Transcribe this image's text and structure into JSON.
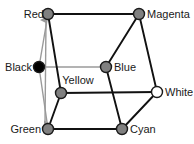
{
  "diagram": {
    "type": "color-cube-vertex-diagram",
    "canvas": {
      "width": 194,
      "height": 144,
      "background": "#ffffff"
    },
    "colors": {
      "vertex_fill_gray": "#808080",
      "vertex_fill_black": "#000000",
      "vertex_fill_white": "#ffffff",
      "vertex_stroke": "#1a1a1a",
      "edge_black": "#111111",
      "edge_gray": "#9a9a9a",
      "arrow_gray": "#9a9a9a",
      "label_color": "#1a1a1a"
    },
    "nodes": [
      {
        "id": "red",
        "label": "Red",
        "x": 48,
        "y": 14,
        "r": 5.5,
        "fill": "#808080",
        "label_pos": "left",
        "lx": 44,
        "ly": 14
      },
      {
        "id": "magenta",
        "label": "Magenta",
        "x": 139,
        "y": 14,
        "r": 5.5,
        "fill": "#808080",
        "label_pos": "right",
        "lx": 147,
        "ly": 14
      },
      {
        "id": "black",
        "label": "Black",
        "x": 39,
        "y": 67,
        "r": 5.5,
        "fill": "#000000",
        "label_pos": "left",
        "lx": 32,
        "ly": 67
      },
      {
        "id": "blue",
        "label": "Blue",
        "x": 106,
        "y": 67,
        "r": 5.5,
        "fill": "#808080",
        "label_pos": "right",
        "lx": 114,
        "ly": 67
      },
      {
        "id": "yellow",
        "label": "Yellow",
        "x": 61,
        "y": 93,
        "r": 5.5,
        "fill": "#808080",
        "label_pos": "above",
        "lx": 78,
        "ly": 86
      },
      {
        "id": "white",
        "label": "White",
        "x": 157,
        "y": 92,
        "r": 5.5,
        "fill": "#ffffff",
        "label_pos": "right",
        "lx": 165,
        "ly": 92
      },
      {
        "id": "green",
        "label": "Green",
        "x": 48,
        "y": 129,
        "r": 5.5,
        "fill": "#808080",
        "label_pos": "left",
        "lx": 41,
        "ly": 129
      },
      {
        "id": "cyan",
        "label": "Cyan",
        "x": 122,
        "y": 129,
        "r": 5.5,
        "fill": "#808080",
        "label_pos": "right",
        "lx": 130,
        "ly": 129
      }
    ],
    "edges": [
      {
        "id": "red-magenta",
        "from": "red",
        "to": "magenta",
        "style": "black"
      },
      {
        "id": "red-yellow",
        "from": "red",
        "to": "yellow",
        "style": "black"
      },
      {
        "id": "red-black",
        "from": "red",
        "to": "black",
        "style": "gray"
      },
      {
        "id": "black-blue",
        "from": "black",
        "to": "blue",
        "style": "gray"
      },
      {
        "id": "black-green",
        "from": "black",
        "to": "green",
        "style": "gray"
      },
      {
        "id": "magenta-blue",
        "from": "magenta",
        "to": "blue",
        "style": "black"
      },
      {
        "id": "magenta-white",
        "from": "magenta",
        "to": "white",
        "style": "black"
      },
      {
        "id": "blue-cyan",
        "from": "blue",
        "to": "cyan",
        "style": "black"
      },
      {
        "id": "yellow-white",
        "from": "yellow",
        "to": "white",
        "style": "black"
      },
      {
        "id": "yellow-green",
        "from": "yellow",
        "to": "green",
        "style": "black"
      },
      {
        "id": "white-cyan",
        "from": "white",
        "to": "cyan",
        "style": "black"
      },
      {
        "id": "green-cyan",
        "from": "green",
        "to": "cyan",
        "style": "black"
      }
    ],
    "arrow": {
      "id": "gray-axis-arrow",
      "description": "double-headed gray arrow from near Red down to near Green",
      "x1": 46,
      "y1": 20,
      "x2": 45,
      "y2": 124,
      "color": "#9a9a9a",
      "double_headed": true
    }
  }
}
